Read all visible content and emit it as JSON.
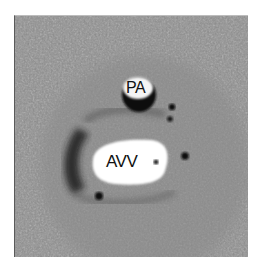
{
  "image": {
    "type": "phase-contrast MRI cross-section",
    "labels": [
      {
        "id": "pa",
        "text": "PA"
      },
      {
        "id": "avv",
        "text": "AVV"
      }
    ],
    "colors": {
      "background_gray": "#8a8a8a",
      "bright_signal": "#ffffff",
      "dark_signal": "#141414"
    }
  }
}
